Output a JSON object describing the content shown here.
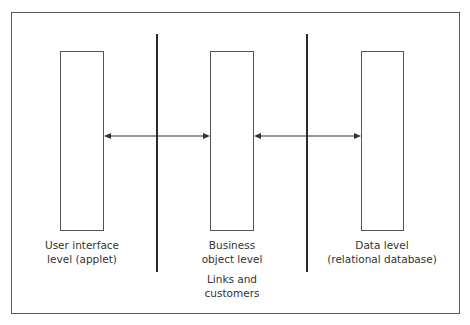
{
  "diagram": {
    "tiers": [
      {
        "id": "ui",
        "label_line1": "User interface",
        "label_line2": "level (applet)"
      },
      {
        "id": "business",
        "label_line1": "Business",
        "label_line2": "object level",
        "sub_line1": "Links and",
        "sub_line2": "customers"
      },
      {
        "id": "data",
        "label_line1": "Data level",
        "label_line2": "(relational database)"
      }
    ],
    "connectors": [
      {
        "from": "ui",
        "to": "business",
        "type": "bidirectional-arrow"
      },
      {
        "from": "business",
        "to": "data",
        "type": "bidirectional-arrow"
      }
    ],
    "colors": {
      "line": "#2a2a2a",
      "box_border": "#555555",
      "text": "#333333",
      "background": "#ffffff"
    }
  }
}
